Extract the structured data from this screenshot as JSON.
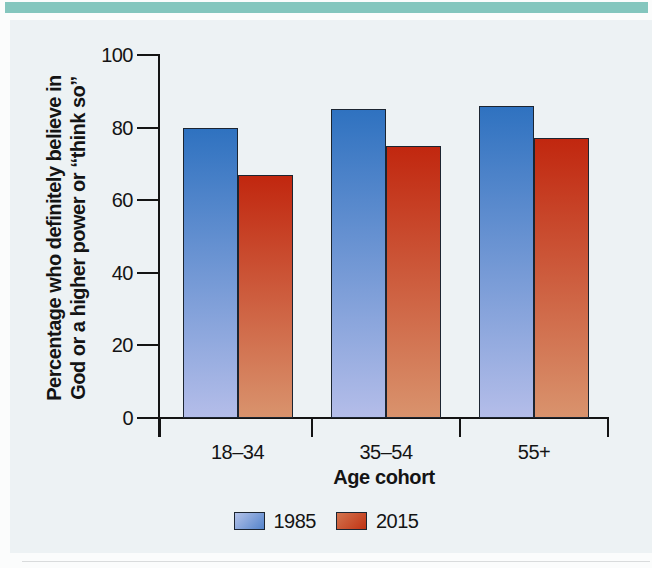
{
  "page": {
    "top_band_color": "#84c6be",
    "panel_bg_color": "#edf2f4",
    "axis_color": "#141414",
    "bar_border_color": "#1c2531"
  },
  "chart_data": {
    "type": "bar",
    "title": "",
    "categories": [
      "18–34",
      "35–54",
      "55+"
    ],
    "series": [
      {
        "name": "1985",
        "values": [
          80,
          85,
          86
        ],
        "color_top": "#2f72c0",
        "color_bottom": "#b4bde9",
        "swatch_from": "#b3c2e8",
        "swatch_to": "#5484cc"
      },
      {
        "name": "2015",
        "values": [
          67,
          75,
          77
        ],
        "color_top": "#c1270f",
        "color_bottom": "#d9936d",
        "swatch_from": "#d3744e",
        "swatch_to": "#c03314"
      }
    ],
    "xlabel": "Age cohort",
    "ylabel_line1": "Percentage who definitely believe in",
    "ylabel_line2": "God or a higher power or “think so”",
    "ylim": [
      0,
      100
    ],
    "yticks": [
      0,
      20,
      40,
      60,
      80,
      100
    ],
    "grid": false,
    "legend_position": "bottom"
  }
}
